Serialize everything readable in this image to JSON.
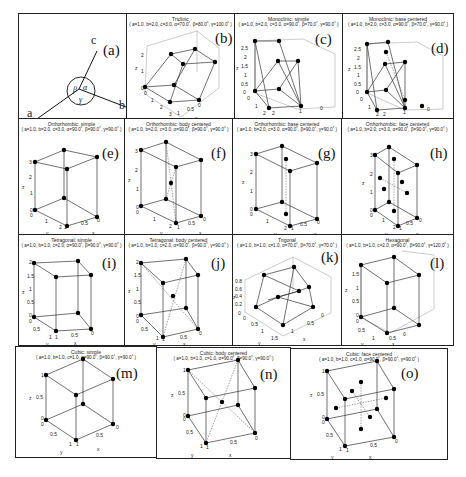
{
  "figure": {
    "panels": [
      {
        "id": "a",
        "label": "(a)",
        "title": "",
        "params": "",
        "axes": {
          "a": "a",
          "b": "b",
          "c": "c",
          "alpha": "α",
          "beta": "β",
          "gamma": "γ"
        }
      },
      {
        "id": "b",
        "label": "(b)",
        "title": "Triclinic",
        "params": "( a=1.0, b=2.0, c=3.0, α=70.0˚, β=80.0˚, γ=100.0˚ )",
        "ticks": {
          "z": [
            "0",
            "1",
            "2"
          ],
          "y": [
            "0",
            "1",
            "2",
            "3"
          ],
          "x": [
            "1",
            "0.5",
            "0"
          ]
        },
        "axis_names": {
          "x": "x",
          "y": "y",
          "z": "z"
        }
      },
      {
        "id": "c",
        "label": "(c)",
        "title": "Monoclinic: simple",
        "params": "( a=1.0, b=2.0, c=3.0, α=90.0˚, β=70.0˚, γ=90.0˚ )",
        "ticks": {
          "z": [
            "0",
            "0.5",
            "1",
            "1.5",
            "2",
            "2.5"
          ],
          "y": [
            "0",
            "1",
            "2"
          ],
          "x": [
            "2",
            "1",
            "0"
          ]
        },
        "axis_names": {
          "x": "x",
          "y": "y",
          "z": "z"
        }
      },
      {
        "id": "d",
        "label": "(d)",
        "title": "Monoclinic: base centered",
        "params": "( a=1.0, b=2.0, c=3.0, α=90.0˚, β=70.0˚, γ=90.0˚ )",
        "ticks": {
          "z": [
            "0",
            "0.5",
            "1",
            "1.5",
            "2",
            "2.5"
          ],
          "y": [
            "0",
            "1",
            "2"
          ],
          "x": [
            "2",
            "1",
            "0"
          ]
        },
        "axis_names": {
          "x": "x",
          "y": "y",
          "z": "z"
        }
      },
      {
        "id": "e",
        "label": "(e)",
        "title": "Orthorhombic: simple",
        "params": "( a=1.0, b=2.0, c=3.0, α=90.0˚, β=90.0˚, γ=90.0˚ )",
        "ticks": {
          "z": [
            "0",
            "1",
            "2",
            "3"
          ],
          "y": [
            "0",
            "1",
            "2"
          ],
          "x": [
            "1",
            "0.5",
            "0"
          ]
        },
        "axis_names": {
          "x": "x",
          "y": "y",
          "z": "z"
        }
      },
      {
        "id": "f",
        "label": "(f)",
        "title": "Orthorhombic: body centered",
        "params": "( a=1.0, b=2.0, c=3.0, α=90.0˚, β=90.0˚, γ=90.0˚ )",
        "ticks": {
          "z": [
            "0",
            "1",
            "2",
            "3"
          ],
          "y": [
            "0",
            "1",
            "2"
          ],
          "x": [
            "1",
            "0.5",
            "0"
          ]
        },
        "axis_names": {
          "x": "x",
          "y": "y",
          "z": "z"
        }
      },
      {
        "id": "g",
        "label": "(g)",
        "title": "Orthorhombic: base centered",
        "params": "( a=1.0, b=2.0, c=3.0, α=90.0˚, β=90.0˚, γ=90.0˚ )",
        "ticks": {
          "z": [
            "0",
            "1",
            "2",
            "3"
          ],
          "y": [
            "0",
            "1",
            "2"
          ],
          "x": [
            "1",
            "0.5",
            "0"
          ]
        },
        "axis_names": {
          "x": "x",
          "y": "y",
          "z": "z"
        }
      },
      {
        "id": "h",
        "label": "(h)",
        "title": "Orthorhombic: face centered",
        "params": "( a=1.0, b=2.0, c=3.0, α=90.0˚, β=90.0˚, γ=90.0˚ )",
        "ticks": {
          "z": [
            "0",
            "1",
            "2",
            "3"
          ],
          "y": [
            "0",
            "1",
            "2"
          ],
          "x": [
            "1",
            "0.5",
            "0"
          ]
        },
        "axis_names": {
          "x": "x",
          "y": "y",
          "z": "z"
        }
      },
      {
        "id": "i",
        "label": "(i)",
        "title": "Tetragonal: simple",
        "params": "( a=1.0, b=1.0, c=2.0, α=90.0˚, β=90.0˚, γ=90.0˚ )",
        "ticks": {
          "z": [
            "0",
            "0.5",
            "1",
            "1.5",
            "2"
          ],
          "y": [
            "0",
            "0.5",
            "1"
          ],
          "x": [
            "1",
            "0.5",
            "0"
          ]
        },
        "axis_names": {
          "x": "x",
          "y": "y",
          "z": "z"
        }
      },
      {
        "id": "j",
        "label": "(j)",
        "title": "Tetragonal: body centered",
        "params": "( a=1.0, b=1.0, c=2.0, α=90.0˚, β=90.0˚, γ=90.0˚ )",
        "ticks": {
          "z": [
            "0",
            "0.5",
            "1",
            "1.5",
            "2"
          ],
          "y": [
            "0",
            "0.5",
            "1"
          ],
          "x": [
            "1",
            "0.5",
            "0"
          ]
        },
        "axis_names": {
          "x": "x",
          "y": "y",
          "z": "z"
        }
      },
      {
        "id": "k",
        "label": "(k)",
        "title": "Trigonal",
        "params": "( a=1.0, b=1.0, c=1.0, α=70.0˚, β=70.0˚, γ=70.0˚ )",
        "ticks": {
          "z": [
            "0",
            "0.2",
            "0.4",
            "0.6",
            "0.8"
          ],
          "y": [
            "0",
            "0.5",
            "1",
            "1.5"
          ],
          "x": [
            "1",
            "0.5",
            "0"
          ]
        },
        "axis_names": {
          "x": "x",
          "y": "y",
          "z": "z"
        }
      },
      {
        "id": "l",
        "label": "(l)",
        "title": "Hexagonal",
        "params": "( a=1.0, b=1.0, c=2.0, α=90.0˚, β=90.0˚, γ=120.0˚ )",
        "ticks": {
          "z": [
            "0",
            "0.5",
            "1",
            "1.5"
          ],
          "y": [
            "0",
            "0.5",
            "1"
          ],
          "x": [
            "0.5",
            "0"
          ]
        },
        "axis_names": {
          "x": "x",
          "y": "y",
          "z": "z"
        }
      },
      {
        "id": "m",
        "label": "(m)",
        "title": "Cubic: simple",
        "params": "( a=1.0, b=1.0, c=1.0, α=90.0˚, β=90.0˚, γ=90.0˚ )",
        "ticks": {
          "z": [
            "0",
            "0.5",
            "1"
          ],
          "y": [
            "0",
            "0.5",
            "1"
          ],
          "x": [
            "1",
            "0.5",
            "0"
          ]
        },
        "axis_names": {
          "x": "x",
          "y": "y",
          "z": "z"
        }
      },
      {
        "id": "n",
        "label": "(n)",
        "title": "Cubic: body centered",
        "params": "( a=1.0, b=1.0, c=1.0, α=90.0˚, β=90.0˚, γ=90.0˚ )",
        "ticks": {
          "z": [
            "0",
            "0.5",
            "1"
          ],
          "y": [
            "0",
            "0.5",
            "1"
          ],
          "x": [
            "1",
            "0.5",
            "0"
          ]
        },
        "axis_names": {
          "x": "x",
          "y": "y",
          "z": "z"
        }
      },
      {
        "id": "o",
        "label": "(o)",
        "title": "Cubic: face centered",
        "params": "( a=1.0, b=1.0, c=1.0, α=90.0˚, β=90.0˚, γ=90.0˚ )",
        "ticks": {
          "z": [
            "0",
            "0.5",
            "1"
          ],
          "y": [
            "0",
            "0.5",
            "1"
          ],
          "x": [
            "1",
            "0.5",
            "0"
          ]
        },
        "axis_names": {
          "x": "x",
          "y": "y",
          "z": "z"
        }
      }
    ]
  }
}
